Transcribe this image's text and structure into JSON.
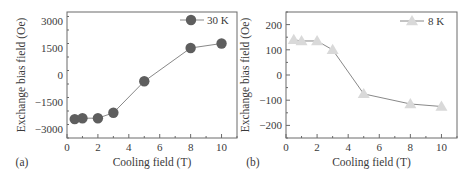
{
  "chart_data": [
    {
      "type": "line",
      "panel_label": "(a)",
      "title": "",
      "xlabel": "Cooling field (T)",
      "ylabel": "Exchange bias field (Oe)",
      "xlim": [
        0,
        11
      ],
      "ylim": [
        -3500,
        3500
      ],
      "xticks": [
        0,
        2,
        4,
        6,
        8,
        10
      ],
      "xtick_labels": [
        "0",
        "2",
        "4",
        "6",
        "8",
        "10"
      ],
      "yticks": [
        3000,
        1500,
        0,
        -1500,
        -3000
      ],
      "ytick_labels": [
        "3000",
        "1500",
        "0",
        "−1500",
        "−3000"
      ],
      "grid": false,
      "legend_position": "top-right",
      "series": [
        {
          "name": "30 K",
          "marker": "circle",
          "color": "#5e5e5e",
          "x": [
            0.5,
            1,
            2,
            3,
            5,
            8,
            10
          ],
          "y": [
            -2450,
            -2400,
            -2400,
            -2100,
            -350,
            1500,
            1750
          ]
        }
      ]
    },
    {
      "type": "line",
      "panel_label": "(b)",
      "title": "",
      "xlabel": "Cooling field (T)",
      "ylabel": "Exchange bias field (Oe)",
      "xlim": [
        0,
        11
      ],
      "ylim": [
        -250,
        250
      ],
      "xticks": [
        0,
        2,
        4,
        6,
        8,
        10
      ],
      "xtick_labels": [
        "0",
        "2",
        "4",
        "6",
        "8",
        "10"
      ],
      "yticks": [
        200,
        100,
        0,
        -100,
        -200
      ],
      "ytick_labels": [
        "200",
        "100",
        "0",
        "−100",
        "−200"
      ],
      "grid": false,
      "legend_position": "top-right",
      "series": [
        {
          "name": "8 K",
          "marker": "triangle",
          "color": "#d9d9d9",
          "x": [
            0.5,
            1,
            2,
            3,
            5,
            8,
            10
          ],
          "y": [
            140,
            135,
            135,
            100,
            -75,
            -115,
            -125
          ]
        }
      ]
    }
  ]
}
